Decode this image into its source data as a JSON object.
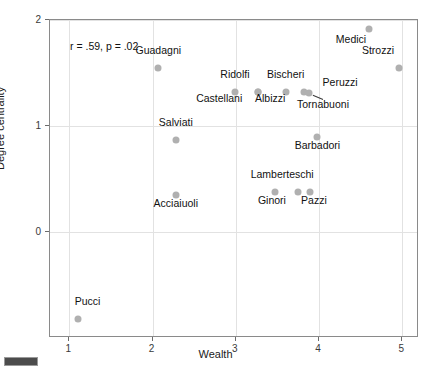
{
  "chart_data": {
    "type": "scatter",
    "title": "",
    "xlabel": "Wealth",
    "ylabel": "Degree centrality",
    "xlim": [
      0.77,
      5.2
    ],
    "ylim": [
      -1.0,
      2.0
    ],
    "xticks": [
      1,
      2,
      3,
      4,
      5
    ],
    "xtick_labels": [
      "1",
      "2",
      "3",
      "4",
      "5"
    ],
    "yticks": [
      0,
      1,
      2
    ],
    "ytick_labels": [
      "0",
      "1",
      "2"
    ],
    "grid": true,
    "legend": "none",
    "annotation": "r = .59, p = .02",
    "annotation_r": ".59",
    "annotation_p": ".02",
    "marker_color": "#b0b0b0",
    "grid_color": "#e2e2e2",
    "axis_color": "#8a8a8a",
    "points": [
      {
        "label": "Medici",
        "x": 4.6,
        "y": 1.92,
        "label_dx": -18,
        "label_dy": 10,
        "leader": false
      },
      {
        "label": "Strozzi",
        "x": 4.96,
        "y": 1.55,
        "label_dx": -21,
        "label_dy": -18,
        "leader": false
      },
      {
        "label": "Guadagni",
        "x": 2.07,
        "y": 1.55,
        "label_dx": 0,
        "label_dy": -18,
        "leader": false
      },
      {
        "label": "Ridolfi",
        "x": 2.99,
        "y": 1.32,
        "label_dx": 0,
        "label_dy": -18,
        "leader": false
      },
      {
        "label": "Bischeri",
        "x": 3.6,
        "y": 1.32,
        "label_dx": 0,
        "label_dy": -18,
        "leader": false
      },
      {
        "label": "Castellani",
        "x": 3.27,
        "y": 1.32,
        "label_dx": -39,
        "label_dy": 6,
        "leader": false
      },
      {
        "label": "Albizzi",
        "x": 3.27,
        "y": 1.32,
        "label_dx": 12,
        "label_dy": 6,
        "leader": false
      },
      {
        "label": "Peruzzi",
        "x": 3.82,
        "y": 1.32,
        "label_dx": 36,
        "label_dy": -10,
        "leader": false
      },
      {
        "label": "Tornabuoni",
        "x": 3.88,
        "y": 1.31,
        "label_dx": 14,
        "label_dy": 11,
        "leader": true
      },
      {
        "label": "Salviati",
        "x": 2.28,
        "y": 0.87,
        "label_dx": 0,
        "label_dy": -18,
        "leader": false
      },
      {
        "label": "Barbadori",
        "x": 3.98,
        "y": 0.9,
        "label_dx": 0,
        "label_dy": 8,
        "leader": false
      },
      {
        "label": "Lamberteschi",
        "x": 3.75,
        "y": 0.38,
        "label_dx": -16,
        "label_dy": -18,
        "leader": false
      },
      {
        "label": "Ginori",
        "x": 3.47,
        "y": 0.38,
        "label_dx": -3,
        "label_dy": 8,
        "leader": false
      },
      {
        "label": "Pazzi",
        "x": 3.89,
        "y": 0.38,
        "label_dx": 4,
        "label_dy": 8,
        "leader": false
      },
      {
        "label": "Acciaiuoli",
        "x": 2.28,
        "y": 0.35,
        "label_dx": 0,
        "label_dy": 8,
        "leader": false
      },
      {
        "label": "Pucci",
        "x": 1.1,
        "y": -0.82,
        "label_dx": 10,
        "label_dy": -18,
        "leader": false
      }
    ]
  },
  "axes": {
    "xlabel": "Wealth",
    "ylabel": "Degree centrality"
  }
}
